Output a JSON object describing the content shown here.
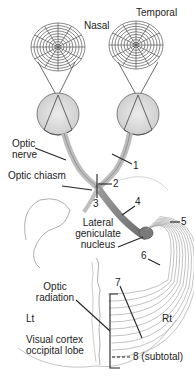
{
  "labels": {
    "nasal": "Nasal",
    "temporal": "Temporal",
    "optic_nerve_1": "Optic",
    "optic_nerve_2": "nerve",
    "optic_chiasm": "Optic chiasm",
    "lgn_1": "Lateral",
    "lgn_2": "geniculate",
    "lgn_3": "nucleus",
    "optic_radiation_1": "Optic",
    "optic_radiation_2": "radiation",
    "left": "Lt",
    "right": "Rt",
    "visual_cortex_1": "Visual cortex",
    "visual_cortex_2": "occipital lobe"
  },
  "lesions": [
    {
      "id": "1",
      "label": "1"
    },
    {
      "id": "2",
      "label": "2"
    },
    {
      "id": "3",
      "label": "3"
    },
    {
      "id": "4",
      "label": "4"
    },
    {
      "id": "5",
      "label": "5"
    },
    {
      "id": "6",
      "label": "6"
    },
    {
      "id": "7",
      "label": "7"
    },
    {
      "id": "8",
      "label": "8 (subtotal)"
    }
  ]
}
